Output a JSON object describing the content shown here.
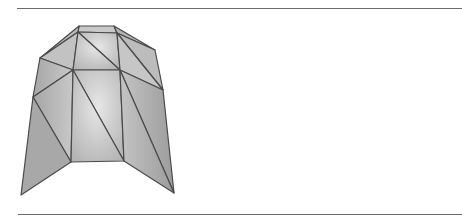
{
  "figure": {
    "colors": {
      "rule": "#6a6a6a",
      "edge": "#4a4a4a",
      "face_light": "#d8d8d8",
      "face_mid": "#bdbdbd",
      "face_dark": "#9e9e9e"
    },
    "vertices": {
      "t1": [
        79,
        26
      ],
      "t2": [
        114,
        26
      ],
      "u1": [
        78,
        32
      ],
      "u2": [
        117,
        33
      ],
      "sl": [
        40,
        58
      ],
      "sr": [
        155,
        50
      ],
      "m1": [
        73,
        70
      ],
      "m2": [
        120,
        70
      ],
      "l1": [
        33,
        97
      ],
      "r1": [
        163,
        90
      ],
      "b1": [
        71,
        162
      ],
      "b2": [
        124,
        161
      ],
      "bl": [
        21,
        195
      ],
      "br": [
        174,
        193
      ]
    }
  }
}
